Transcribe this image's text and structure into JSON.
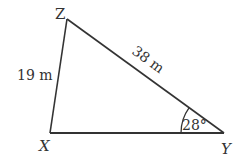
{
  "diagram": {
    "type": "triangle",
    "vertices": {
      "Z": {
        "label": "Z",
        "x": 67,
        "y": 19
      },
      "X": {
        "label": "X",
        "x": 50,
        "y": 133
      },
      "Y": {
        "label": "Y",
        "x": 224,
        "y": 133
      }
    },
    "sides": {
      "XZ": {
        "label": "19 m"
      },
      "ZY": {
        "label": "38 m"
      }
    },
    "angles": {
      "Y": {
        "label": "28°"
      }
    },
    "colors": {
      "line": "#333333",
      "text": "#333333",
      "background": "#ffffff"
    }
  }
}
